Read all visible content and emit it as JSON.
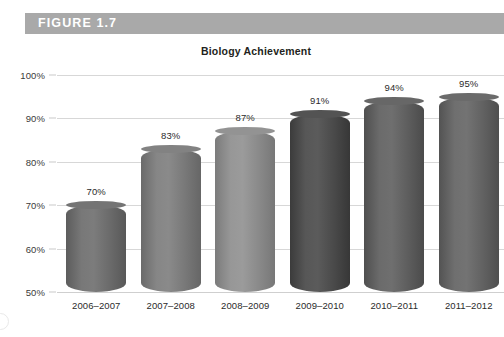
{
  "figure": {
    "band_label": "FIGURE 1.7",
    "band_color": "#a9a9a9"
  },
  "chart_data": {
    "type": "bar",
    "title": "Biology Achievement",
    "xlabel": "",
    "ylabel": "",
    "categories": [
      "2006–2007",
      "2007–2008",
      "2008–2009",
      "2009–2010",
      "2010–2011",
      "2011–2012"
    ],
    "values": [
      70,
      83,
      87,
      91,
      94,
      95
    ],
    "value_labels": [
      "70%",
      "83%",
      "87%",
      "91%",
      "94%",
      "95%"
    ],
    "ylim": [
      50,
      100
    ],
    "ytick_values": [
      100,
      90,
      80,
      70,
      60,
      50
    ],
    "ytick_labels": [
      "100%",
      "90%",
      "80%",
      "70%",
      "60%",
      "50%"
    ],
    "grid": true,
    "legend": "none",
    "bar_style": "cylinder",
    "bar_colors": [
      "#6e6e6e",
      "#7c7c7c",
      "#8d8d8d",
      "#4d4d4d",
      "#616161",
      "#656565"
    ]
  }
}
